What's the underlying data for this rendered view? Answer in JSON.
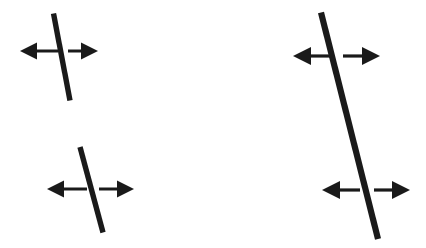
{
  "figure": {
    "width": 426,
    "height": 248,
    "background_color": "#ffffff",
    "ink_color": "#1a1a1a"
  },
  "panels": [
    {
      "id": "left-panel",
      "name": "two-segment-panel",
      "label": "Left panel: two short segments",
      "segments": [
        {
          "id": "left-upper-segment",
          "name": "oblique-line-upper-left",
          "x1": 53.5,
          "y1": 13.5,
          "x2": 70.0,
          "y2": 100.5,
          "thickness": 5.4,
          "angle_deg": 79.3
        },
        {
          "id": "left-lower-segment",
          "name": "oblique-line-lower-left",
          "x1": 80.0,
          "y1": 147.0,
          "x2": 103.0,
          "y2": 232.5,
          "thickness": 5.4,
          "angle_deg": 75.0
        }
      ],
      "arrows": [
        {
          "id": "left-upper-arrow",
          "name": "double-headed-arrow-upper-left",
          "y": 51.0,
          "x_left_tip": 20.0,
          "x_right_tip": 98.0,
          "gap_left": 58.0,
          "gap_right": 68.0,
          "shaft_thickness": 3.0,
          "head_length": 17.0,
          "head_half_width": 8.5
        },
        {
          "id": "left-lower-arrow",
          "name": "double-headed-arrow-lower-left",
          "y": 189.0,
          "x_left_tip": 47.0,
          "x_right_tip": 134.0,
          "gap_left": 87.0,
          "gap_right": 99.0,
          "shaft_thickness": 3.0,
          "head_length": 17.0,
          "head_half_width": 8.5
        }
      ]
    },
    {
      "id": "right-panel",
      "name": "single-line-panel",
      "label": "Right panel: one continuous line",
      "segments": [
        {
          "id": "right-long-line",
          "name": "oblique-line-continuous-right",
          "x1": 321.0,
          "y1": 12.5,
          "x2": 378.0,
          "y2": 239.0,
          "thickness": 6.2,
          "angle_deg": 75.9
        }
      ],
      "arrows": [
        {
          "id": "right-upper-arrow",
          "name": "double-headed-arrow-upper-right",
          "y": 56.0,
          "x_left_tip": 293.0,
          "x_right_tip": 380.0,
          "gap_left": 330.0,
          "gap_right": 343.0,
          "shaft_thickness": 3.2,
          "head_length": 18.0,
          "head_half_width": 9.0
        },
        {
          "id": "right-lower-arrow",
          "name": "double-headed-arrow-lower-right",
          "y": 190.0,
          "x_left_tip": 322.0,
          "x_right_tip": 410.0,
          "gap_left": 360.0,
          "gap_right": 374.0,
          "shaft_thickness": 3.2,
          "head_length": 18.0,
          "head_half_width": 9.0
        }
      ]
    }
  ]
}
